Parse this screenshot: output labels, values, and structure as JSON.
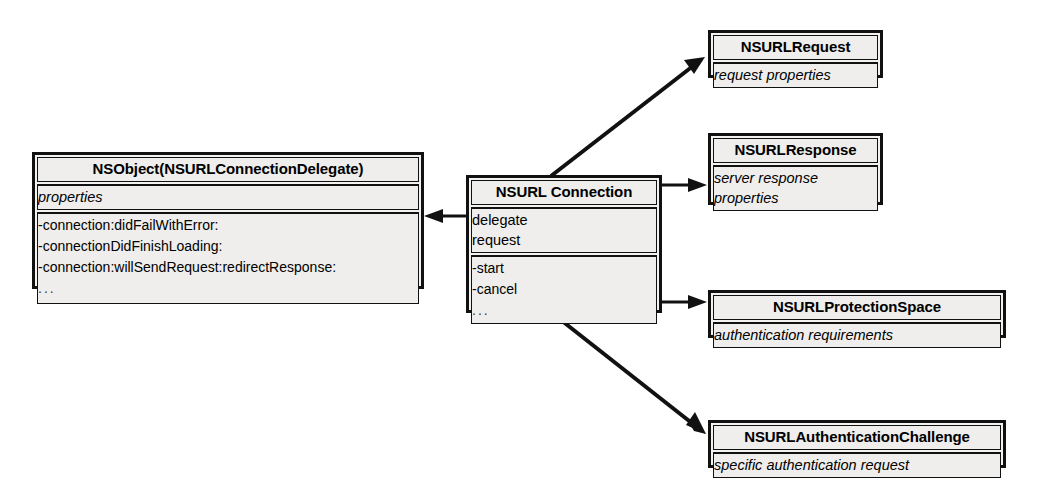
{
  "diagram": {
    "type": "uml-class-diagram",
    "colors": {
      "stroke": "#111111",
      "box_fill": "#f2f2f0",
      "section_fill": "#efeeec",
      "background": "#ffffff"
    }
  },
  "boxes": {
    "nsobject": {
      "name": "NSObject(NSURLConnectionDelegate)",
      "attributes": [
        "properties"
      ],
      "operations": [
        "-connection:didFailWithError:",
        "-connectionDidFinishLoading:",
        "-connection:willSendRequest:redirectResponse:",
        "..."
      ]
    },
    "nsurlconnection": {
      "name": "NSURL Connection",
      "attributes": [
        "delegate",
        "request"
      ],
      "operations": [
        "-start",
        "-cancel",
        "..."
      ]
    },
    "nsurlrequest": {
      "name": "NSURLRequest",
      "attributes": [
        "request properties"
      ]
    },
    "nsurlresponse": {
      "name": "NSURLResponse",
      "attributes": [
        "server response",
        "properties"
      ]
    },
    "nsurlprotectionspace": {
      "name": "NSURLProtectionSpace",
      "attributes": [
        "authentication requirements"
      ]
    },
    "nsurlauthenticationchallenge": {
      "name": "NSURLAuthenticationChallenge",
      "attributes": [
        "specific authentication request"
      ]
    }
  },
  "connectors": [
    {
      "id": "conn-to-delegate",
      "from": "nsurlconnection",
      "to": "nsobject",
      "direction": "left",
      "style": "solid-arrow"
    },
    {
      "id": "conn-to-request",
      "from": "nsurlconnection",
      "to": "nsurlrequest",
      "direction": "up-right",
      "style": "solid-arrow"
    },
    {
      "id": "conn-to-response",
      "from": "nsurlconnection",
      "to": "nsurlresponse",
      "direction": "right",
      "style": "solid-arrow"
    },
    {
      "id": "conn-to-protectionspace",
      "from": "nsurlconnection",
      "to": "nsurlprotectionspace",
      "direction": "right",
      "style": "solid-arrow"
    },
    {
      "id": "conn-to-authchallenge",
      "from": "nsurlconnection",
      "to": "nsurlauthenticationchallenge",
      "direction": "down-right",
      "style": "solid-arrow"
    }
  ]
}
